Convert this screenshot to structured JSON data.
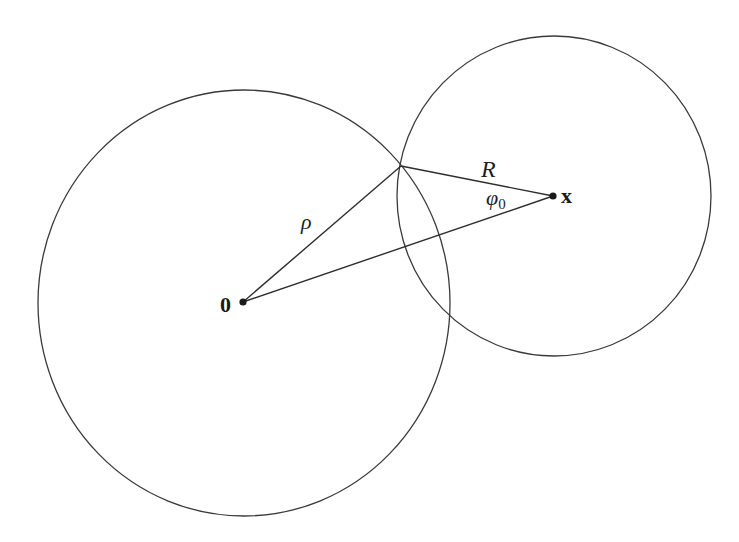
{
  "figure": {
    "colors": {
      "background": "#ffffff",
      "stroke": "#333333",
      "text": "#1f1f1f"
    },
    "circles": [
      {
        "id": "origin-circle",
        "cx": 244,
        "cy": 303,
        "rx": 206,
        "ry": 213
      },
      {
        "id": "x-circle",
        "cx": 554,
        "cy": 196,
        "rx": 157,
        "ry": 160
      }
    ],
    "points": {
      "origin": {
        "x": 243,
        "y": 302,
        "label": "0"
      },
      "x": {
        "x": 553,
        "y": 196,
        "label": "x"
      },
      "intersection": {
        "x": 401,
        "y": 166
      }
    },
    "segments": [
      {
        "id": "rho-segment",
        "from": "origin",
        "to": "intersection",
        "label": "ρ"
      },
      {
        "id": "R-segment",
        "from": "intersection",
        "to": "x",
        "label": "R"
      },
      {
        "id": "origin-to-x-segment",
        "from": "origin",
        "to": "x"
      }
    ],
    "labels": {
      "origin": "0",
      "x": "x",
      "rho": "ρ",
      "R": "R",
      "phi": "φ",
      "phi_sub": "0"
    }
  }
}
